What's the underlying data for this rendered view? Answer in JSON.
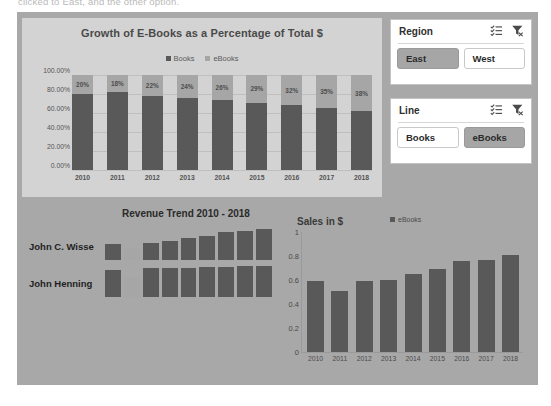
{
  "page": {
    "cut_off_text": "clicked to East, and the other option.",
    "canvas_color": "#a8a8a8",
    "panel_color": "#d3d3d3",
    "books_color": "#595959",
    "ebooks_color": "#a6a6a6",
    "accent_selected": "#a6a6a6"
  },
  "main_chart": {
    "title": "Growth of E-Books as a Percentage of Total $",
    "legend": [
      "Books",
      "eBooks"
    ],
    "ylabels": [
      "100.00%",
      "80.00%",
      "60.00%",
      "40.00%",
      "20.00%",
      "0.00%"
    ]
  },
  "slicers": [
    {
      "title": "Region",
      "multi_select_icon": "multi-select-icon",
      "clear_filter_icon": "clear-filter-icon",
      "options": [
        {
          "label": "East",
          "selected": true
        },
        {
          "label": "West",
          "selected": false
        }
      ]
    },
    {
      "title": "Line",
      "multi_select_icon": "multi-select-icon",
      "clear_filter_icon": "clear-filter-icon",
      "options": [
        {
          "label": "Books",
          "selected": false
        },
        {
          "label": "eBooks",
          "selected": true
        }
      ]
    }
  ],
  "sparklines": {
    "title": "Revenue Trend 2010 - 2018",
    "rows": [
      {
        "name": "John C. Wisse"
      },
      {
        "name": "John Henning"
      }
    ]
  },
  "sales_chart": {
    "title": "Sales in $",
    "legend": [
      "eBooks"
    ],
    "ylabels": [
      "1",
      "0.8",
      "0.6",
      "0.4",
      "0.2",
      "0"
    ]
  },
  "chart_data": [
    {
      "type": "bar",
      "id": "growth-of-ebooks-stacked-bar",
      "title": "Growth of E-Books as a Percentage of Total $",
      "stacked": true,
      "stack_mode": "percent",
      "xlabel": "",
      "ylabel": "",
      "ylim": [
        0,
        1
      ],
      "ytick_labels": [
        "0.00%",
        "20.00%",
        "40.00%",
        "60.00%",
        "80.00%",
        "100.00%"
      ],
      "grid": true,
      "legend": [
        "Books",
        "eBooks"
      ],
      "legend_position": "top",
      "categories": [
        "2010",
        "2011",
        "2012",
        "2013",
        "2014",
        "2015",
        "2016",
        "2017",
        "2018"
      ],
      "series": [
        {
          "name": "Books",
          "values": [
            0.8,
            0.82,
            0.78,
            0.76,
            0.74,
            0.71,
            0.68,
            0.65,
            0.62
          ]
        },
        {
          "name": "eBooks",
          "values": [
            0.2,
            0.18,
            0.22,
            0.24,
            0.26,
            0.29,
            0.32,
            0.35,
            0.38
          ],
          "data_labels": [
            "20%",
            "18%",
            "22%",
            "24%",
            "26%",
            "29%",
            "32%",
            "35%",
            "38%"
          ]
        }
      ]
    },
    {
      "type": "bar",
      "id": "revenue-trend-sparklines",
      "title": "Revenue Trend 2010 - 2018",
      "grid": false,
      "legend": [],
      "categories": [
        "2010",
        "2011",
        "2012",
        "2013",
        "2014",
        "2015",
        "2016",
        "2017",
        "2018"
      ],
      "series": [
        {
          "name": "John C. Wisse",
          "values": [
            0.52,
            0.4,
            0.56,
            0.62,
            0.7,
            0.78,
            0.9,
            0.92,
            1.0
          ]
        },
        {
          "name": "John Henning",
          "values": [
            0.86,
            0.66,
            0.92,
            0.94,
            0.95,
            0.96,
            0.98,
            0.99,
            1.0
          ]
        }
      ]
    },
    {
      "type": "bar",
      "id": "sales-in-dollars-bar",
      "title": "Sales in $",
      "xlabel": "",
      "ylabel": "",
      "ylim": [
        0,
        1
      ],
      "ytick_labels": [
        "0",
        "0.2",
        "0.4",
        "0.6",
        "0.8",
        "1"
      ],
      "grid": false,
      "legend": [
        "eBooks"
      ],
      "legend_position": "top-right",
      "categories": [
        "2010",
        "2011",
        "2012",
        "2013",
        "2014",
        "2015",
        "2016",
        "2017",
        "2018"
      ],
      "series": [
        {
          "name": "eBooks",
          "values": [
            0.59,
            0.51,
            0.59,
            0.6,
            0.65,
            0.69,
            0.76,
            0.77,
            0.81
          ]
        }
      ]
    }
  ]
}
